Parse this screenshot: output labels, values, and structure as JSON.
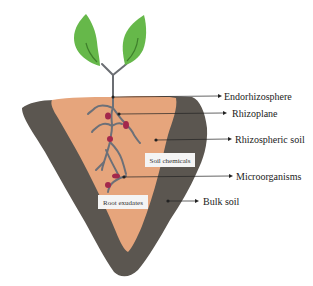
{
  "diagram": {
    "colors": {
      "background": "#ffffff",
      "bulk_soil": "#5b5650",
      "bulk_soil_edge": "#4a4540",
      "rhizosphere": "#e6a57c",
      "leaf": "#66b84a",
      "leaf_vein": "#3e7f2b",
      "stem": "#6b6e73",
      "root": "#6c7078",
      "microorganism": "#a3284c",
      "pointer": "#222222",
      "label_box": "#f4f4f4"
    },
    "labels": [
      {
        "id": "endorhizosphere",
        "text": "Endorhizosphere"
      },
      {
        "id": "rhizoplane",
        "text": "Rhizoplane"
      },
      {
        "id": "rhizospheric_soil",
        "text": "Rhizospheric soil"
      },
      {
        "id": "microorganisms",
        "text": "Microorganisms"
      },
      {
        "id": "bulk_soil",
        "text": "Bulk soil"
      }
    ],
    "boxes": [
      {
        "id": "soil_chemicals",
        "text": "Soil chemicals"
      },
      {
        "id": "root_exudates",
        "text": "Root exudates"
      }
    ]
  }
}
